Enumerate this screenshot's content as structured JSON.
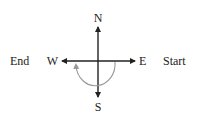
{
  "diagram": {
    "type": "compass-rotation",
    "directions": {
      "north": "N",
      "south": "S",
      "east": "E",
      "west": "W"
    },
    "labels": {
      "start": "Start",
      "end": "End"
    },
    "colors": {
      "axes": "#222222",
      "arc": "#999999",
      "text": "#222222"
    },
    "rotation": "clockwise from East through South to West"
  }
}
